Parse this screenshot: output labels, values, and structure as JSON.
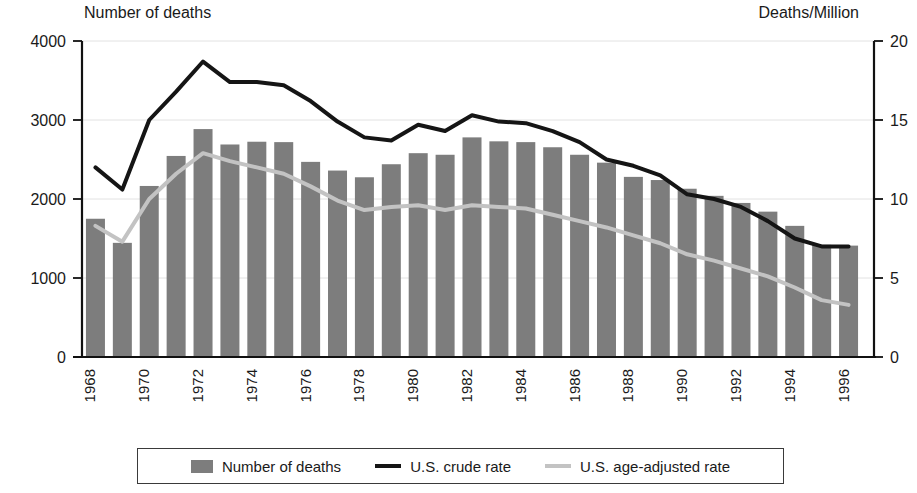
{
  "labels": {
    "left_axis_title": "Number of deaths",
    "right_axis_title": "Deaths/Million"
  },
  "legend": {
    "bars": "Number of deaths",
    "crude": "U.S. crude rate",
    "adjusted": "U.S. age-adjusted rate"
  },
  "colors": {
    "bar": "#7d7d7d",
    "crude_line": "#151515",
    "adjusted_line": "#c3c3c3",
    "axis": "#111111",
    "grid": "#e2e2e2"
  },
  "chart_data": {
    "type": "bar",
    "title": "",
    "xlabel": "",
    "ylabel": "Number of deaths",
    "y2label": "Deaths/Million",
    "ylim": [
      0,
      4000
    ],
    "y2lim": [
      0,
      20
    ],
    "yticks": [
      0,
      1000,
      2000,
      3000,
      4000
    ],
    "y2ticks": [
      0,
      5,
      10,
      15,
      20
    ],
    "ytick_labels": [
      "0",
      "1000",
      "2000",
      "3000",
      "4000"
    ],
    "y2tick_labels": [
      "0",
      "5",
      "10",
      "15",
      "20"
    ],
    "grid": true,
    "legend_position": "bottom",
    "categories": [
      1968,
      1969,
      1970,
      1971,
      1972,
      1973,
      1974,
      1975,
      1976,
      1977,
      1978,
      1979,
      1980,
      1981,
      1982,
      1983,
      1984,
      1985,
      1986,
      1987,
      1988,
      1989,
      1990,
      1991,
      1992,
      1993,
      1994,
      1995,
      1996
    ],
    "xtick_labels": [
      "1968",
      "1969",
      "1970",
      "1971",
      "1972",
      "1973",
      "1974",
      "1975",
      "1976",
      "1977",
      "1978",
      "1979",
      "1980",
      "1981",
      "1982",
      "1983",
      "1984",
      "1985",
      "1986",
      "1987",
      "1988",
      "1989",
      "1990",
      "1991",
      "1992",
      "1993",
      "1994",
      "1995",
      "1996"
    ],
    "xtick_labels_shown": [
      "1968",
      "1970",
      "1972",
      "1974",
      "1976",
      "1978",
      "1980",
      "1982",
      "1984",
      "1986",
      "1988",
      "1990",
      "1992",
      "1994",
      "1996"
    ],
    "series": [
      {
        "name": "Number of deaths",
        "type": "bar",
        "axis": "left",
        "values": [
          1750,
          1445,
          2165,
          2545,
          2885,
          2690,
          2725,
          2720,
          2470,
          2360,
          2275,
          2440,
          2580,
          2560,
          2780,
          2730,
          2720,
          2655,
          2560,
          2460,
          2280,
          2240,
          2130,
          2040,
          1950,
          1840,
          1660,
          1420,
          1410
        ]
      },
      {
        "name": "U.S. crude rate",
        "type": "line",
        "axis": "right",
        "values": [
          12.0,
          10.6,
          15.0,
          16.8,
          18.7,
          17.4,
          17.4,
          17.2,
          16.2,
          14.9,
          13.9,
          13.7,
          14.7,
          14.3,
          15.3,
          14.9,
          14.8,
          14.3,
          13.6,
          12.5,
          12.1,
          11.5,
          10.3,
          10.0,
          9.5,
          8.6,
          7.5,
          7.0,
          7.0
        ]
      },
      {
        "name": "U.S. age-adjusted rate",
        "type": "line",
        "axis": "right",
        "values": [
          8.3,
          7.3,
          10.0,
          11.6,
          12.9,
          12.4,
          12.0,
          11.6,
          10.8,
          9.9,
          9.3,
          9.5,
          9.6,
          9.3,
          9.6,
          9.5,
          9.4,
          9.0,
          8.6,
          8.2,
          7.7,
          7.2,
          6.5,
          6.1,
          5.6,
          5.1,
          4.4,
          3.6,
          3.3
        ]
      }
    ]
  }
}
